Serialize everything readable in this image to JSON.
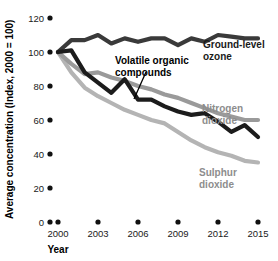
{
  "chart_data": {
    "type": "line",
    "title": "",
    "xlabel": "Year",
    "ylabel": "Average concentration (Index, 2000 = 100)",
    "xlim": [
      2000,
      2015
    ],
    "ylim": [
      0,
      120
    ],
    "grid": false,
    "legend_position": "inline-right",
    "x": [
      2000,
      2001,
      2002,
      2003,
      2004,
      2005,
      2006,
      2007,
      2008,
      2009,
      2010,
      2011,
      2012,
      2013,
      2014,
      2015
    ],
    "y_ticks": [
      0,
      20,
      40,
      60,
      80,
      100,
      120
    ],
    "x_ticks": [
      2000,
      2003,
      2006,
      2009,
      2012,
      2015
    ],
    "series": [
      {
        "name": "Ground-level ozone",
        "color": "#3a3a3a",
        "label_color": "#1a1a1a",
        "values": [
          100,
          107,
          107,
          110,
          105,
          108,
          106,
          108,
          108,
          104,
          108,
          106,
          110,
          109,
          108,
          108
        ]
      },
      {
        "name": "Volatile organic compounds",
        "color": "#1c1c1c",
        "label_color": "#000000",
        "values": [
          100,
          101,
          88,
          82,
          76,
          84,
          72,
          72,
          68,
          65,
          63,
          64,
          59,
          53,
          57,
          50
        ]
      },
      {
        "name": "Nitrogen dioxide",
        "color": "#9a9a9a",
        "label_color": "#8d8d8d",
        "values": [
          100,
          93,
          87,
          88,
          85,
          83,
          80,
          78,
          75,
          73,
          70,
          67,
          64,
          62,
          60,
          60
        ]
      },
      {
        "name": "Sulphur dioxide",
        "color": "#b4b4b4",
        "label_color": "#8d8d8d",
        "values": [
          100,
          88,
          79,
          74,
          70,
          66,
          63,
          60,
          58,
          53,
          48,
          44,
          41,
          39,
          36,
          35
        ]
      }
    ]
  },
  "axes": {
    "y_title": "Average concentration (Index, 2000 = 100)",
    "x_title": "Year",
    "y_tick_labels": [
      "120",
      "100",
      "80",
      "60",
      "40",
      "20",
      "0"
    ],
    "x_tick_labels": [
      "2000",
      "2003",
      "2006",
      "2009",
      "2012",
      "2015"
    ]
  },
  "annotations": {
    "ozone_label_line1": "Ground-level",
    "ozone_label_line2": "ozone",
    "voc_label_line1": "Volatile organic",
    "voc_label_line2": "compounds",
    "no2_label_line1": "Nitrogen",
    "no2_label_line2": "dioxide",
    "so2_label_line1": "Sulphur",
    "so2_label_line2": "dioxide"
  },
  "colors": {
    "ozone": "#3a3a3a",
    "voc": "#1c1c1c",
    "nitrogen_dioxide": "#9a9a9a",
    "sulphur_dioxide": "#b4b4b4",
    "axis_text": "#1a1a1a",
    "background": "#ffffff"
  }
}
